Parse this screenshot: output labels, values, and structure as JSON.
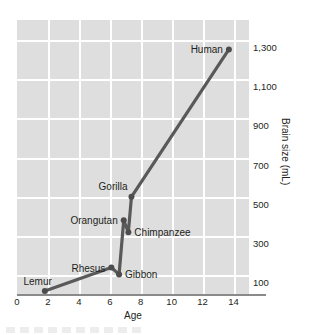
{
  "chart_data": {
    "type": "line",
    "title": "",
    "xlabel": "Age",
    "ylabel": "Brain size (mL)",
    "xlim": [
      0,
      15
    ],
    "ylim": [
      0,
      1400
    ],
    "xticks": [
      "0",
      "2",
      "4",
      "6",
      "8",
      "10",
      "12",
      "14"
    ],
    "xtick_values": [
      0,
      2,
      4,
      6,
      8,
      10,
      12,
      14
    ],
    "yticks": [
      "100",
      "300",
      "500",
      "700",
      "900",
      "1,100",
      "1,300"
    ],
    "ytick_values": [
      100,
      300,
      500,
      700,
      900,
      1100,
      1300
    ],
    "grid": true,
    "legend": "none",
    "series": [
      {
        "name": "Brain size vs age",
        "x": [
          1.8,
          6.1,
          6.6,
          6.9,
          7.2,
          7.4,
          13.7
        ],
        "y": [
          20,
          140,
          105,
          380,
          320,
          500,
          1250
        ],
        "labels": [
          "Lemur",
          "Rhesus",
          "Gibbon",
          "Orangutan",
          "Chimpanzee",
          "Gorilla",
          "Human"
        ]
      }
    ],
    "points": [
      {
        "label": "Lemur",
        "x": 1.8,
        "y": 20,
        "label_pos": "above-right"
      },
      {
        "label": "Rhesus",
        "x": 6.1,
        "y": 140,
        "label_pos": "left"
      },
      {
        "label": "Gibbon",
        "x": 6.6,
        "y": 105,
        "label_pos": "right"
      },
      {
        "label": "Orangutan",
        "x": 6.9,
        "y": 380,
        "label_pos": "left"
      },
      {
        "label": "Chimpanzee",
        "x": 7.2,
        "y": 320,
        "label_pos": "right"
      },
      {
        "label": "Gorilla",
        "x": 7.4,
        "y": 500,
        "label_pos": "above-left"
      },
      {
        "label": "Human",
        "x": 13.7,
        "y": 1250,
        "label_pos": "left"
      }
    ],
    "colors": {
      "line": "#595959",
      "marker": "#4d4d4d",
      "panel": "#dedede",
      "grid": "#ffffff",
      "axis": "#8a8a8a",
      "text": "#231f20"
    }
  }
}
